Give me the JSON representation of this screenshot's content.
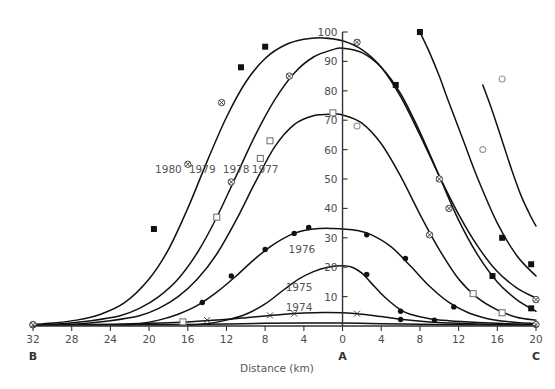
{
  "chart_data": {
    "type": "line",
    "title": "",
    "xlabel": "Distance (km)",
    "ylabel": "",
    "xlim": [
      -32,
      20
    ],
    "ylim": [
      0,
      100
    ],
    "grid": false,
    "legend_position": "inline-curve-labels",
    "x_tick_labels": [
      "32",
      "28",
      "24",
      "20",
      "16",
      "12",
      "8",
      "4",
      "0",
      "4",
      "8",
      "12",
      "16",
      "20"
    ],
    "x_tick_values": [
      -32,
      -28,
      -24,
      -20,
      -16,
      -12,
      -8,
      -4,
      0,
      4,
      8,
      12,
      16,
      20
    ],
    "y_tick_labels": [
      "10",
      "20",
      "30",
      "40",
      "50",
      "60",
      "70",
      "80",
      "90",
      "100"
    ],
    "y_tick_values": [
      10,
      20,
      30,
      40,
      50,
      60,
      70,
      80,
      90,
      100
    ],
    "axis_endpoints": [
      {
        "name": "left-endpoint",
        "label": "B",
        "x": -32
      },
      {
        "name": "center-endpoint",
        "label": "A",
        "x": 0
      },
      {
        "name": "right-endpoint",
        "label": "C",
        "x": 20
      }
    ],
    "series": [
      {
        "name": "1980",
        "label": "1980",
        "marker": "filled-square",
        "label_x": -18.0,
        "label_y": 52.0,
        "x": [
          -32.0,
          -30.0,
          -27.5,
          -25.0,
          -22.5,
          -20.0,
          -18.0,
          -16.0,
          -14.0,
          -12.0,
          -10.0,
          -8.0,
          -6.0,
          -4.0,
          -2.0,
          0.0,
          2.0,
          4.0,
          6.0,
          8.0,
          10.0,
          12.0,
          14.0,
          16.0,
          18.0,
          20.0
        ],
        "y": [
          0.5,
          1.0,
          2.0,
          4.0,
          8.0,
          16.0,
          26.0,
          40.0,
          56.0,
          71.0,
          83.0,
          91.0,
          95.5,
          97.5,
          98.0,
          97.0,
          94.0,
          88.0,
          78.0,
          65.0,
          51.0,
          38.0,
          27.0,
          18.5,
          13.0,
          9.5
        ],
        "points": [
          {
            "x": -19.5,
            "y": 33.0,
            "marker": "filled-square"
          },
          {
            "x": -16.0,
            "y": 55.0,
            "marker": "crossed-circle"
          },
          {
            "x": -12.5,
            "y": 76.0,
            "marker": "crossed-circle"
          },
          {
            "x": -10.5,
            "y": 88.0,
            "marker": "filled-square"
          },
          {
            "x": -8.0,
            "y": 95.0,
            "marker": "filled-square"
          },
          {
            "x": 1.5,
            "y": 96.5,
            "marker": "crossed-circle"
          },
          {
            "x": 11.0,
            "y": 40.0,
            "marker": "crossed-circle"
          },
          {
            "x": 20.0,
            "y": 9.0,
            "marker": "crossed-circle"
          }
        ]
      },
      {
        "name": "1979",
        "label": "1979",
        "marker": "crossed-circle",
        "label_x": -14.5,
        "label_y": 52.0,
        "x": [
          -32.0,
          -29.0,
          -26.0,
          -23.0,
          -21.0,
          -19.0,
          -17.0,
          -15.0,
          -13.0,
          -11.0,
          -9.0,
          -7.0,
          -5.0,
          -3.0,
          -1.0,
          0.0,
          2.0,
          4.0,
          6.0,
          8.0,
          10.0,
          12.0,
          14.0,
          16.0,
          18.0,
          20.0
        ],
        "y": [
          0.3,
          0.8,
          1.8,
          3.5,
          6.0,
          10.0,
          16.0,
          25.0,
          37.0,
          51.0,
          65.0,
          77.0,
          86.0,
          91.5,
          94.0,
          94.5,
          93.0,
          88.0,
          79.0,
          66.0,
          51.0,
          36.0,
          24.0,
          15.0,
          9.0,
          5.0
        ],
        "points": [
          {
            "x": -11.5,
            "y": 49.0,
            "marker": "crossed-circle"
          },
          {
            "x": -5.5,
            "y": 85.0,
            "marker": "crossed-circle"
          },
          {
            "x": 5.5,
            "y": 82.0,
            "marker": "filled-square"
          },
          {
            "x": 10.0,
            "y": 50.0,
            "marker": "crossed-circle"
          },
          {
            "x": 15.5,
            "y": 17.0,
            "marker": "filled-square"
          },
          {
            "x": 19.5,
            "y": 6.0,
            "marker": "filled-square"
          }
        ]
      },
      {
        "name": "1978",
        "label": "1978",
        "marker": "open-square",
        "label_x": -11.0,
        "label_y": 52.0,
        "x": [
          -30.0,
          -27.0,
          -24.0,
          -21.0,
          -19.0,
          -17.0,
          -15.0,
          -13.0,
          -11.0,
          -9.0,
          -7.0,
          -5.0,
          -3.0,
          -1.0,
          0.0,
          2.0,
          4.0,
          6.0,
          8.0,
          10.0,
          12.0,
          14.0,
          16.0,
          18.0,
          20.0
        ],
        "y": [
          0.3,
          0.8,
          1.8,
          3.5,
          6.0,
          10.0,
          16.0,
          24.5,
          36.0,
          49.0,
          61.0,
          68.5,
          71.5,
          72.0,
          71.8,
          69.0,
          62.0,
          51.0,
          38.0,
          26.0,
          16.0,
          9.5,
          5.5,
          3.0,
          2.0
        ],
        "points": [
          {
            "x": -13.0,
            "y": 37.0,
            "marker": "open-square"
          },
          {
            "x": -8.5,
            "y": 57.0,
            "marker": "open-square"
          },
          {
            "x": -7.5,
            "y": 63.0,
            "marker": "open-square"
          },
          {
            "x": -1.0,
            "y": 72.5,
            "marker": "open-square"
          },
          {
            "x": 1.5,
            "y": 68.0,
            "marker": "open-circle"
          },
          {
            "x": 9.0,
            "y": 31.0,
            "marker": "crossed-circle"
          },
          {
            "x": 13.5,
            "y": 11.0,
            "marker": "open-square"
          },
          {
            "x": 16.5,
            "y": 4.5,
            "marker": "open-square"
          }
        ]
      },
      {
        "name": "1977",
        "label": "1977",
        "marker": "filled-circle",
        "label_x": -8.0,
        "label_y": 52.0,
        "x": [
          -23.0,
          -21.0,
          -19.0,
          -17.0,
          -15.0,
          -13.0,
          -11.0,
          -9.0,
          -7.0,
          -5.0,
          -3.0,
          -1.0,
          0.0,
          1.5,
          3.0,
          5.0,
          7.0,
          9.0,
          11.0,
          13.0,
          15.0,
          17.0,
          20.0
        ],
        "y": [
          0.3,
          0.8,
          2.0,
          4.0,
          7.0,
          11.5,
          17.0,
          23.0,
          28.0,
          31.5,
          33.0,
          33.2,
          33.0,
          32.5,
          31.0,
          27.0,
          20.5,
          13.5,
          8.0,
          4.5,
          2.5,
          1.5,
          0.8
        ],
        "points": [
          {
            "x": -14.5,
            "y": 8.0,
            "marker": "filled-circle"
          },
          {
            "x": -11.5,
            "y": 17.0,
            "marker": "filled-circle"
          },
          {
            "x": -8.0,
            "y": 26.0,
            "marker": "filled-circle"
          },
          {
            "x": -5.0,
            "y": 31.5,
            "marker": "filled-circle"
          },
          {
            "x": -3.5,
            "y": 33.5,
            "marker": "filled-circle"
          },
          {
            "x": 2.5,
            "y": 31.0,
            "marker": "filled-circle"
          },
          {
            "x": 6.5,
            "y": 23.0,
            "marker": "filled-circle"
          },
          {
            "x": 11.5,
            "y": 6.5,
            "marker": "filled-circle"
          }
        ]
      },
      {
        "name": "1976",
        "label": "1976",
        "marker": "filled-circle",
        "label_x": -4.2,
        "label_y": 25.0,
        "x": [
          -16.0,
          -14.0,
          -12.0,
          -10.0,
          -8.0,
          -6.0,
          -4.5,
          -3.0,
          -1.5,
          0.0,
          1.0,
          2.0,
          3.0,
          4.0,
          5.0,
          6.0,
          7.0,
          9.0,
          11.0,
          14.0,
          17.0,
          20.0
        ],
        "y": [
          0.3,
          0.8,
          2.0,
          4.0,
          7.5,
          12.5,
          16.0,
          18.5,
          20.0,
          20.5,
          20.0,
          18.0,
          14.5,
          11.0,
          8.0,
          5.5,
          4.0,
          2.5,
          1.8,
          1.2,
          0.8,
          0.5
        ],
        "points": [
          {
            "x": 2.5,
            "y": 17.5,
            "marker": "filled-circle"
          },
          {
            "x": 6.0,
            "y": 5.0,
            "marker": "filled-circle"
          },
          {
            "x": 9.5,
            "y": 2.0,
            "marker": "filled-circle"
          }
        ]
      },
      {
        "name": "1975",
        "label": "1975",
        "marker": "cross",
        "label_x": -4.5,
        "label_y": 12.0,
        "x": [
          -32.0,
          -28.0,
          -24.0,
          -20.0,
          -16.0,
          -13.0,
          -10.0,
          -8.0,
          -6.0,
          -4.0,
          -2.0,
          0.0,
          2.0,
          4.0,
          6.0,
          9.0,
          12.0,
          16.0,
          20.0
        ],
        "y": [
          0.2,
          0.4,
          0.6,
          0.9,
          1.4,
          2.0,
          2.8,
          3.4,
          4.0,
          4.4,
          4.6,
          4.5,
          4.0,
          3.2,
          2.3,
          1.4,
          0.9,
          0.5,
          0.3
        ],
        "points": [
          {
            "x": -32.0,
            "y": 0.5,
            "marker": "crossed-circle"
          },
          {
            "x": -16.5,
            "y": 1.4,
            "marker": "open-square"
          },
          {
            "x": -14.0,
            "y": 2.0,
            "marker": "cross"
          },
          {
            "x": -7.5,
            "y": 3.6,
            "marker": "cross"
          },
          {
            "x": -5.0,
            "y": 4.2,
            "marker": "cross"
          },
          {
            "x": 1.5,
            "y": 4.2,
            "marker": "cross"
          },
          {
            "x": 6.0,
            "y": 2.2,
            "marker": "filled-circle"
          },
          {
            "x": 20.0,
            "y": 0.5,
            "marker": "crossed-circle"
          }
        ]
      },
      {
        "name": "1974",
        "label": "1974",
        "marker": "crossed-circle",
        "label_x": -4.5,
        "label_y": 5.0,
        "x": [
          -32.0,
          -28.0,
          -24.0,
          -20.0,
          -16.0,
          -12.0,
          -8.0,
          -4.0,
          0.0,
          4.0,
          8.0,
          12.0,
          16.0,
          20.0
        ],
        "y": [
          0.3,
          0.3,
          0.35,
          0.4,
          0.5,
          0.7,
          0.9,
          1.0,
          1.0,
          0.8,
          0.6,
          0.45,
          0.35,
          0.3
        ],
        "points": [
          {
            "x": -32.0,
            "y": 0.4,
            "marker": "crossed-circle"
          }
        ]
      },
      {
        "name": "right-outer-curve",
        "label": "",
        "marker": "open-circle",
        "label_x": null,
        "label_y": null,
        "x": [
          8.0,
          9.0,
          10.0,
          11.0,
          12.5,
          14.0,
          16.0,
          18.0,
          20.0
        ],
        "y": [
          100.0,
          93.0,
          85.0,
          76.0,
          63.0,
          50.0,
          35.0,
          24.0,
          17.0
        ],
        "points": [
          {
            "x": 8.0,
            "y": 100.0,
            "marker": "filled-square"
          },
          {
            "x": 16.5,
            "y": 30.0,
            "marker": "filled-square"
          },
          {
            "x": 19.5,
            "y": 21.0,
            "marker": "filled-square"
          }
        ]
      },
      {
        "name": "far-right-curve",
        "label": "",
        "marker": "open-circle",
        "label_x": null,
        "label_y": null,
        "x": [
          14.5,
          15.5,
          16.5,
          17.5,
          18.5,
          19.5,
          20.0
        ],
        "y": [
          82.0,
          73.0,
          63.0,
          53.0,
          44.0,
          37.0,
          34.0
        ],
        "points": [
          {
            "x": 16.5,
            "y": 84.0,
            "marker": "open-circle"
          },
          {
            "x": 14.5,
            "y": 60.0,
            "marker": "open-circle"
          }
        ]
      }
    ]
  }
}
